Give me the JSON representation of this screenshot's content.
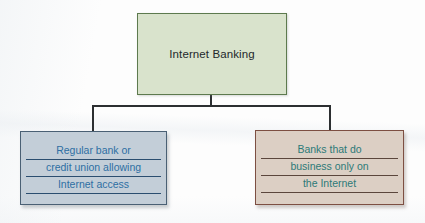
{
  "diagram": {
    "type": "hierarchy-tree",
    "background_color": "#fdfdfd",
    "root": {
      "label": "Internet Banking",
      "fill_color": "#d9e3cc",
      "border_color": "#5d7a4e",
      "text_color": "#23282b"
    },
    "children": [
      {
        "id": "regular-bank",
        "fill_color": "#c3ced8",
        "border_color": "#4a6074",
        "text_color": "#2e6fa3",
        "underline_color": "#2b4e70",
        "lines": [
          "Regular bank or",
          "credit union allowing",
          "Internet access"
        ]
      },
      {
        "id": "internet-only-bank",
        "fill_color": "#dccfc4",
        "border_color": "#7d4f42",
        "text_color": "#2c7a78",
        "underline_color": "#5b463c",
        "lines": [
          "Banks that do",
          "business only on",
          "the Internet"
        ]
      }
    ],
    "connector_color": "#2c2f31"
  }
}
